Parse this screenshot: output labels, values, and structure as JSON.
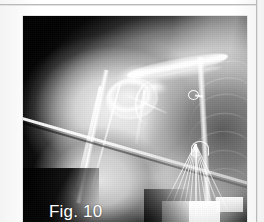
{
  "page": {
    "kind": "scanned-book-page",
    "background_color": "#fcfcfc",
    "rule_color": "#b9b9b9"
  },
  "figure": {
    "label": "Fig. 10",
    "label_color": "#ffffff",
    "modality": "radiograph",
    "region": "right shoulder and proximal humerus, anteroposterior view",
    "frame": {
      "x": 23,
      "y": 16,
      "width": 224,
      "height": 206
    },
    "film_background_color": "#0a0a0a",
    "findings": [
      "proximal humerus and humeral head",
      "glenohumeral joint with glenoid rim",
      "clavicle and acromion",
      "coracoid process",
      "scapula lateral border",
      "right rib cage with lung field",
      "radiopaque circular marker",
      "external sling straps crossing the arm",
      "fan of cerclage wires / sutures with bright pad"
    ]
  },
  "anatomy": {
    "ribs": [
      {
        "left": 78,
        "top": 22,
        "width": 26,
        "height": 20,
        "rotate": -14,
        "opacity": 0.5
      },
      {
        "left": 76,
        "top": 30,
        "width": 28,
        "height": 22,
        "rotate": -12,
        "opacity": 0.5
      },
      {
        "left": 75,
        "top": 38,
        "width": 29,
        "height": 24,
        "rotate": -10,
        "opacity": 0.48
      },
      {
        "left": 74,
        "top": 47,
        "width": 30,
        "height": 25,
        "rotate": -8,
        "opacity": 0.45
      },
      {
        "left": 74,
        "top": 56,
        "width": 30,
        "height": 26,
        "rotate": -6,
        "opacity": 0.42
      },
      {
        "left": 75,
        "top": 65,
        "width": 29,
        "height": 26,
        "rotate": -4,
        "opacity": 0.38
      },
      {
        "left": 77,
        "top": 74,
        "width": 27,
        "height": 25,
        "rotate": -2,
        "opacity": 0.32
      }
    ],
    "wires": [
      {
        "rotate": -26
      },
      {
        "rotate": -20
      },
      {
        "rotate": -15
      },
      {
        "rotate": -10
      },
      {
        "rotate": -5
      },
      {
        "rotate": 0
      },
      {
        "rotate": 5
      },
      {
        "rotate": 10
      },
      {
        "rotate": 15
      },
      {
        "rotate": 21
      },
      {
        "rotate": 27
      }
    ]
  }
}
